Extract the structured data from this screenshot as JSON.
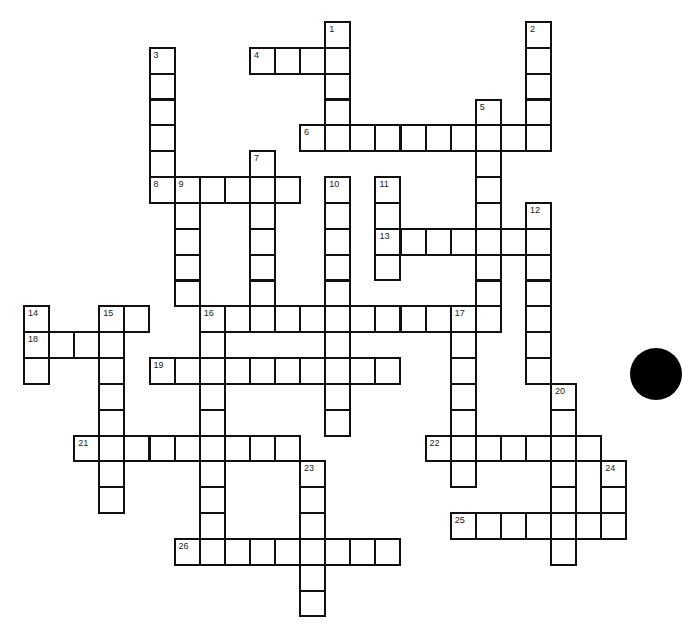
{
  "puzzle": {
    "type": "crossword",
    "cell_fill": "#ffffff",
    "line_color": "#111111",
    "words": [
      {
        "number": "1",
        "direction": "down",
        "row": 0,
        "col": 12,
        "length": 5
      },
      {
        "number": "2",
        "direction": "down",
        "row": 0,
        "col": 20,
        "length": 5
      },
      {
        "number": "3",
        "direction": "down",
        "row": 1,
        "col": 5,
        "length": 6
      },
      {
        "number": "4",
        "direction": "across",
        "row": 1,
        "col": 9,
        "length": 4
      },
      {
        "number": "5",
        "direction": "down",
        "row": 3,
        "col": 18,
        "length": 9
      },
      {
        "number": "6",
        "direction": "across",
        "row": 4,
        "col": 11,
        "length": 10
      },
      {
        "number": "7",
        "direction": "down",
        "row": 5,
        "col": 9,
        "length": 7
      },
      {
        "number": "8",
        "direction": "across",
        "row": 6,
        "col": 5,
        "length": 6
      },
      {
        "number": "9",
        "direction": "down",
        "row": 6,
        "col": 6,
        "length": 5
      },
      {
        "number": "10",
        "direction": "down",
        "row": 6,
        "col": 12,
        "length": 10
      },
      {
        "number": "11",
        "direction": "down",
        "row": 6,
        "col": 14,
        "length": 4
      },
      {
        "number": "12",
        "direction": "down",
        "row": 7,
        "col": 20,
        "length": 7
      },
      {
        "number": "13",
        "direction": "across",
        "row": 8,
        "col": 14,
        "length": 7
      },
      {
        "number": "14",
        "direction": "down",
        "row": 11,
        "col": 0,
        "length": 3
      },
      {
        "number": "15",
        "direction": "across",
        "row": 11,
        "col": 3,
        "length": 2
      },
      {
        "number": "15",
        "direction": "down",
        "row": 11,
        "col": 3,
        "length": 8
      },
      {
        "number": "16",
        "direction": "across",
        "row": 11,
        "col": 7,
        "length": 12
      },
      {
        "number": "16",
        "direction": "down",
        "row": 11,
        "col": 7,
        "length": 10
      },
      {
        "number": "17",
        "direction": "down",
        "row": 11,
        "col": 17,
        "length": 7
      },
      {
        "number": "18",
        "direction": "across",
        "row": 12,
        "col": 0,
        "length": 4
      },
      {
        "number": "19",
        "direction": "across",
        "row": 13,
        "col": 5,
        "length": 10
      },
      {
        "number": "20",
        "direction": "down",
        "row": 14,
        "col": 21,
        "length": 7
      },
      {
        "number": "21",
        "direction": "across",
        "row": 16,
        "col": 2,
        "length": 9
      },
      {
        "number": "22",
        "direction": "across",
        "row": 16,
        "col": 16,
        "length": 7
      },
      {
        "number": "23",
        "direction": "down",
        "row": 17,
        "col": 11,
        "length": 6
      },
      {
        "number": "24",
        "direction": "down",
        "row": 17,
        "col": 23,
        "length": 3
      },
      {
        "number": "25",
        "direction": "across",
        "row": 19,
        "col": 17,
        "length": 7
      },
      {
        "number": "26",
        "direction": "across",
        "row": 20,
        "col": 6,
        "length": 9
      }
    ]
  }
}
